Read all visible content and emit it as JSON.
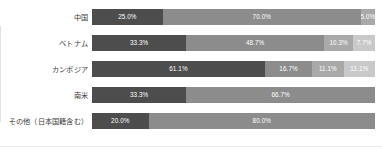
{
  "chart_data": {
    "type": "bar",
    "orientation": "horizontal",
    "stacked": true,
    "normalized": true,
    "title": "",
    "subtitle": "",
    "xlabel": "",
    "ylabel": "",
    "xlim": [
      0,
      100
    ],
    "grid": false,
    "legend": "none",
    "value_suffix": "%",
    "categories": [
      "中国",
      "ベトナム",
      "カンボジア",
      "南米",
      "その他（日本国籍含む）"
    ],
    "series_colors": [
      "#4d4d4d",
      "#8c8c8c",
      "#a9a9a9",
      "#c9c9c9"
    ],
    "rows": [
      {
        "category": "中国",
        "segments": [
          {
            "value": 25.0,
            "label": "25.0%",
            "color": "#4d4d4d",
            "shade": "s0"
          },
          {
            "value": 70.0,
            "label": "70.0%",
            "color": "#8c8c8c",
            "shade": "s1"
          },
          {
            "value": 5.0,
            "label": "5.0%",
            "color": "#a9a9a9",
            "shade": "s2"
          }
        ]
      },
      {
        "category": "ベトナム",
        "segments": [
          {
            "value": 33.3,
            "label": "33.3%",
            "color": "#4d4d4d",
            "shade": "s0"
          },
          {
            "value": 48.7,
            "label": "48.7%",
            "color": "#8c8c8c",
            "shade": "s1"
          },
          {
            "value": 10.3,
            "label": "10.3%",
            "color": "#a9a9a9",
            "shade": "s2"
          },
          {
            "value": 7.7,
            "label": "7.7%",
            "color": "#c9c9c9",
            "shade": "s3"
          }
        ]
      },
      {
        "category": "カンボジア",
        "segments": [
          {
            "value": 61.1,
            "label": "61.1%",
            "color": "#4d4d4d",
            "shade": "s0"
          },
          {
            "value": 16.7,
            "label": "16.7%",
            "color": "#8c8c8c",
            "shade": "s1"
          },
          {
            "value": 11.1,
            "label": "11.1%",
            "color": "#a9a9a9",
            "shade": "s2"
          },
          {
            "value": 11.1,
            "label": "11.1%",
            "color": "#c9c9c9",
            "shade": "s3"
          }
        ]
      },
      {
        "category": "南米",
        "segments": [
          {
            "value": 33.3,
            "label": "33.3%",
            "color": "#4d4d4d",
            "shade": "s0"
          },
          {
            "value": 66.7,
            "label": "66.7%",
            "color": "#8c8c8c",
            "shade": "s1"
          }
        ]
      },
      {
        "category": "その他（日本国籍含む）",
        "segments": [
          {
            "value": 20.0,
            "label": "20.0%",
            "color": "#4d4d4d",
            "shade": "s0"
          },
          {
            "value": 80.0,
            "label": "80.0%",
            "color": "#8c8c8c",
            "shade": "s1"
          }
        ]
      }
    ]
  }
}
